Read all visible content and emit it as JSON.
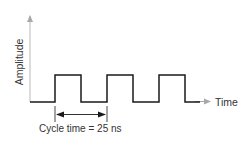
{
  "diagram": {
    "y_axis_label": "Amplitude",
    "x_axis_label": "Time",
    "annotation": "Cycle time = 25 ns",
    "colors": {
      "signal": "#1a1a1a",
      "axis": "#b0b0b0",
      "text": "#333333"
    },
    "signal": {
      "type": "square-wave",
      "pulses": 3,
      "cycle_time": "25 ns"
    }
  }
}
